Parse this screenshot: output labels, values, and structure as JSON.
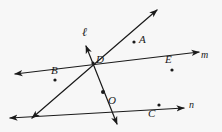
{
  "figure": {
    "kind": "geometry-diagram",
    "width": 222,
    "height": 132,
    "background_color": "#f7f7f7",
    "ink_color": "#1a1a1a",
    "stroke_width": 1.2
  },
  "vertex": {
    "name": "O",
    "label": "O",
    "x": 103,
    "y": 92
  },
  "point_labels": [
    {
      "name": "A",
      "label": "A",
      "x": 142,
      "y": 40,
      "dot_x": 134,
      "dot_y": 42
    },
    {
      "name": "B",
      "label": "B",
      "x": 54,
      "y": 71,
      "dot_x": 55,
      "dot_y": 80
    },
    {
      "name": "C",
      "label": "C",
      "x": 151,
      "y": 114,
      "dot_x": 159,
      "dot_y": 105
    },
    {
      "name": "D",
      "label": "D",
      "x": 98,
      "y": 60,
      "dot_x": 93,
      "dot_y": 63
    },
    {
      "name": "E",
      "label": "E",
      "x": 168,
      "y": 60,
      "dot_x": 172,
      "dot_y": 70
    }
  ],
  "line_labels": [
    {
      "name": "ell",
      "label": "ℓ",
      "x": 84,
      "y": 31
    },
    {
      "name": "m",
      "label": "m",
      "x": 203,
      "y": 56
    },
    {
      "name": "n",
      "label": "n",
      "x": 190,
      "y": 105
    }
  ],
  "lines": [
    {
      "name": "line-ell",
      "label": "ℓ",
      "through": "O",
      "endpoints": [
        {
          "x": 86,
          "y": 46
        },
        {
          "x": 117,
          "y": 124
        }
      ],
      "arrows": "both"
    },
    {
      "name": "line-m",
      "label": "m",
      "through": "O",
      "endpoints": [
        {
          "x": 15,
          "y": 74
        },
        {
          "x": 199,
          "y": 52
        }
      ],
      "arrows": "both"
    },
    {
      "name": "line-n",
      "label": "n",
      "through": "O",
      "endpoints": [
        {
          "x": 10,
          "y": 118
        },
        {
          "x": 184,
          "y": 108
        }
      ],
      "arrows": "both"
    },
    {
      "name": "line-ao",
      "label": "A",
      "through": "O",
      "endpoints": [
        {
          "x": 157,
          "y": 10
        },
        {
          "x": 32,
          "y": 118
        }
      ],
      "arrows": "both"
    }
  ],
  "dots": [
    {
      "name": "dot-O",
      "x": 103,
      "y": 92
    },
    {
      "name": "dot-A",
      "x": 134,
      "y": 42
    },
    {
      "name": "dot-B",
      "x": 55,
      "y": 80
    },
    {
      "name": "dot-C",
      "x": 159,
      "y": 105
    },
    {
      "name": "dot-D",
      "x": 93,
      "y": 63
    },
    {
      "name": "dot-E",
      "x": 172,
      "y": 70
    }
  ]
}
